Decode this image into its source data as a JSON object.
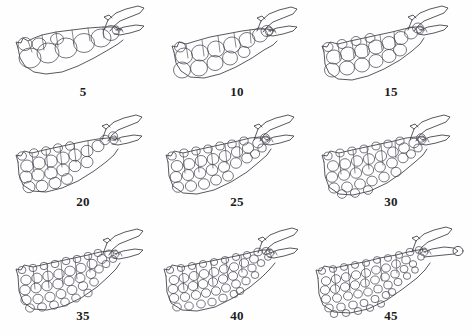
{
  "figure": {
    "type": "scientific-line-drawing-plate",
    "rows": 3,
    "columns": 3,
    "background_color": "#ffffff",
    "ink_color": "#3a3a42",
    "label_color": "#1c1c1c"
  },
  "panels": [
    {
      "id": "panel-5",
      "label": "5",
      "row": 0,
      "col": 0,
      "cell_count": 9,
      "cell_size": "large",
      "description": "slender tapering outline with one row of large rounded cells and a forked head process at upper right"
    },
    {
      "id": "panel-10",
      "label": "10",
      "row": 0,
      "col": 1,
      "cell_count": 13,
      "cell_size": "large",
      "description": "outline with two partial rows of large rounded cells, forked head process at upper right"
    },
    {
      "id": "panel-15",
      "label": "15",
      "row": 0,
      "col": 2,
      "cell_count": 18,
      "cell_size": "medium-large",
      "description": "broader outline with two rows of rounded cells, forked head process at upper right"
    },
    {
      "id": "panel-20",
      "label": "20",
      "row": 1,
      "col": 0,
      "cell_count": 24,
      "cell_size": "medium",
      "description": "outline with three rows of medium rounded cells"
    },
    {
      "id": "panel-25",
      "label": "25",
      "row": 1,
      "col": 1,
      "cell_count": 30,
      "cell_size": "medium",
      "description": "outline with three to four rows of medium rounded cells"
    },
    {
      "id": "panel-30",
      "label": "30",
      "row": 1,
      "col": 2,
      "cell_count": 34,
      "cell_size": "medium",
      "description": "outline with four rows of medium rounded cells"
    },
    {
      "id": "panel-35",
      "label": "35",
      "row": 2,
      "col": 0,
      "cell_count": 40,
      "cell_size": "small-medium",
      "description": "outline with four rows of smaller rounded cells"
    },
    {
      "id": "panel-40",
      "label": "40",
      "row": 2,
      "col": 1,
      "cell_count": 46,
      "cell_size": "small",
      "description": "outline densely packed with small rounded cells in four to five rows"
    },
    {
      "id": "panel-45",
      "label": "45",
      "row": 2,
      "col": 2,
      "cell_count": 52,
      "cell_size": "small",
      "description": "largest outline densely packed with small rounded cells, head process with terminal knob"
    }
  ]
}
